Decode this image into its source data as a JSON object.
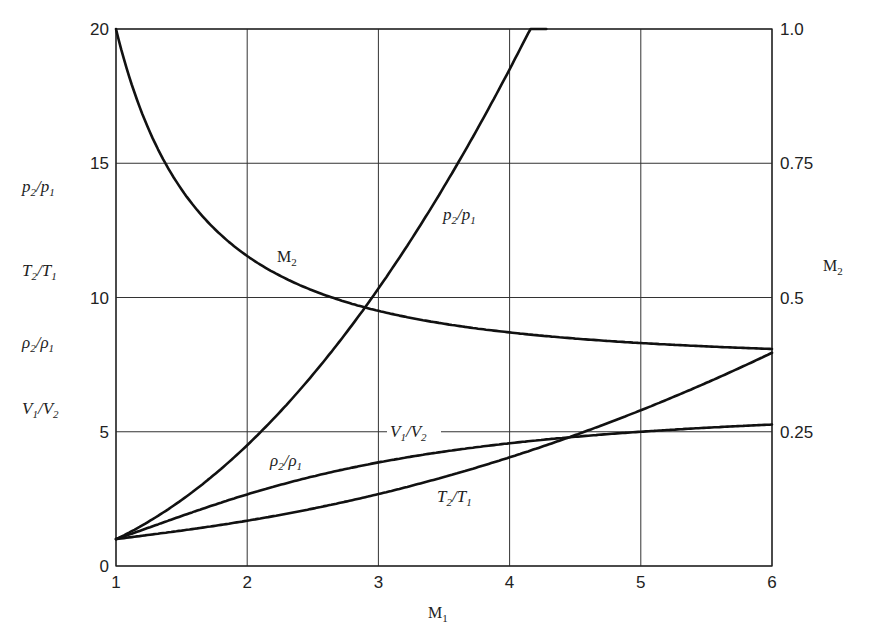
{
  "chart_data": {
    "type": "line",
    "title": "",
    "xlabel": "M1",
    "ylabel_left": [
      "p2/p1",
      "T2/T1",
      "ρ2/ρ1",
      "V1/V2"
    ],
    "ylabel_right": "M2",
    "xlim": [
      1,
      6
    ],
    "ylim_left": [
      0,
      20
    ],
    "ylim_right": [
      0,
      1.0
    ],
    "grid": true,
    "legend": "none (inline curve labels)",
    "x_ticks": [
      "1",
      "2",
      "3",
      "4",
      "5",
      "6"
    ],
    "y_ticks_left": [
      "0",
      "5",
      "10",
      "15",
      "20"
    ],
    "y_ticks_right": [
      "0.25",
      "0.5",
      "0.75",
      "1.0"
    ],
    "x": [
      1,
      1.5,
      2,
      2.5,
      3,
      3.5,
      4,
      4.5,
      5,
      5.5,
      6
    ],
    "series": [
      {
        "name": "p2/p1",
        "axis": "left",
        "values": [
          1.0,
          2.458,
          4.5,
          7.125,
          10.333,
          14.125,
          18.5,
          null,
          null,
          null,
          null
        ],
        "note": "reaches 20 at M1≈4.28, clipped"
      },
      {
        "name": "ρ2/ρ1 (= V1/V2)",
        "axis": "left",
        "values": [
          1.0,
          1.862,
          2.667,
          3.333,
          3.857,
          4.261,
          4.571,
          4.812,
          5.0,
          5.151,
          5.268
        ]
      },
      {
        "name": "T2/T1",
        "axis": "left",
        "values": [
          1.0,
          1.32,
          1.687,
          2.137,
          2.679,
          3.315,
          4.047,
          4.875,
          5.8,
          6.822,
          7.941
        ]
      },
      {
        "name": "M2",
        "axis": "right",
        "values": [
          1.0,
          0.701,
          0.577,
          0.513,
          0.475,
          0.451,
          0.435,
          0.424,
          0.415,
          0.409,
          0.404
        ]
      }
    ],
    "annotations": [
      {
        "text": "M2",
        "near": "M2 curve at M1≈2.3"
      },
      {
        "text": "p2/p1",
        "near": "p2/p1 curve at M1≈2.9"
      },
      {
        "text": "V1/V2",
        "near": "gridline y=5 at M1≈3.2"
      },
      {
        "text": "ρ2/ρ1",
        "near": "ρ2/ρ1 curve at M1≈2.3"
      },
      {
        "text": "T2/T1",
        "near": "T2/T1 curve at M1≈3.6"
      }
    ]
  },
  "labels": {
    "x_axis": {
      "main": "M",
      "sub": "1"
    },
    "right_axis": {
      "main": "M",
      "sub": "2"
    },
    "left_axis": [
      {
        "a": "p",
        "as": "2",
        "b": "p",
        "bs": "1"
      },
      {
        "a": "T",
        "as": "2",
        "b": "T",
        "bs": "1"
      },
      {
        "a": "ρ",
        "as": "2",
        "b": "ρ",
        "bs": "1"
      },
      {
        "a": "V",
        "as": "1",
        "b": "V",
        "bs": "2"
      }
    ],
    "curve_m2": {
      "main": "M",
      "sub": "2"
    },
    "curve_p": {
      "a": "p",
      "as": "2",
      "b": "p",
      "bs": "1"
    },
    "curve_v": {
      "a": "V",
      "as": "1",
      "b": "V",
      "bs": "2"
    },
    "curve_rho": {
      "a": "ρ",
      "as": "2",
      "b": "ρ",
      "bs": "1"
    },
    "curve_t": {
      "a": "T",
      "as": "2",
      "b": "T",
      "bs": "1"
    }
  }
}
